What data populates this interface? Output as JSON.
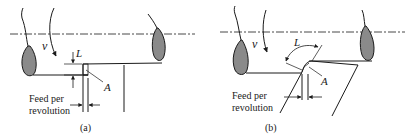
{
  "figure": {
    "panels": [
      {
        "id": "a",
        "caption": "(a)",
        "velocity_label": "v",
        "length_label": "L",
        "point_label": "A",
        "feed_label_line1": "Feed per",
        "feed_label_line2": "revolution"
      },
      {
        "id": "b",
        "caption": "(b)",
        "velocity_label": "v",
        "length_label": "L",
        "point_label": "A",
        "feed_label_line1": "Feed per",
        "feed_label_line2": "revolution"
      }
    ],
    "colors": {
      "line": "#1a1a1a",
      "chip_fill": "#8a8a8a",
      "background": "#ffffff"
    }
  }
}
